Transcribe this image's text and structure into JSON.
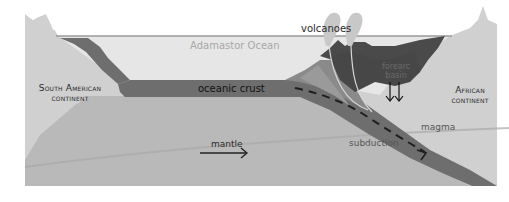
{
  "diagram": {
    "type": "cross-section",
    "labels": {
      "volcanoes": "volcanoes",
      "ocean": "Adamastor Ocean",
      "south_american_continent_line1": "South American",
      "south_american_continent_line2": "continent",
      "african_continent_line1": "African",
      "african_continent_line2": "continent",
      "oceanic_crust": "oceanic crust",
      "forearc_basin_line1": "forearc",
      "forearc_basin_line2": "basin",
      "mantle": "mantle",
      "subduction": "subduction",
      "magma": "magma"
    },
    "colors": {
      "background": "#ffffff",
      "continent": "#d0d0d0",
      "ocean": "#e4e4e4",
      "ocean_surface_line": "#9a9a9a",
      "oceanic_crust": "#6e6e6e",
      "mantle": "#b8b8b8",
      "forearc_basin": "#4a4a4a",
      "accretionary_wedge": "#8a8a8a",
      "volcano_plume": "#c8c8c8",
      "arrow": "#222222"
    }
  }
}
